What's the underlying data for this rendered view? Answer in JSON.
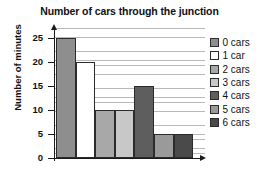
{
  "chart_data": {
    "type": "bar",
    "title": "Number of cars through the junction",
    "xlabel": "",
    "ylabel": "Number of minutes",
    "categories": [
      "0 cars",
      "1 car",
      "2 cars",
      "3 cars",
      "4 cars",
      "5 cars",
      "6 cars"
    ],
    "values": [
      25,
      20,
      10,
      10,
      15,
      5,
      5
    ],
    "ylim": [
      0,
      27
    ],
    "yticks": [
      0,
      5,
      10,
      15,
      20,
      25
    ],
    "ytick_labels": [
      "0",
      "5",
      "10",
      "15",
      "20",
      "25"
    ],
    "grid": "horizontal-minor-every-1",
    "legend_position": "right",
    "bar_colors": [
      "#8e8e8e",
      "#ffffff",
      "#a8a8a8",
      "#c8c8c8",
      "#5e5e5e",
      "#9a9a9a",
      "#4a4a4a"
    ],
    "legend": [
      {
        "label": "0 cars",
        "color": "#8e8e8e"
      },
      {
        "label": "1 car",
        "color": "#ffffff"
      },
      {
        "label": "2 cars",
        "color": "#a8a8a8"
      },
      {
        "label": "3 cars",
        "color": "#c8c8c8"
      },
      {
        "label": "4 cars",
        "color": "#5e5e5e"
      },
      {
        "label": "5 cars",
        "color": "#9a9a9a"
      },
      {
        "label": "6 cars",
        "color": "#4a4a4a"
      }
    ]
  }
}
